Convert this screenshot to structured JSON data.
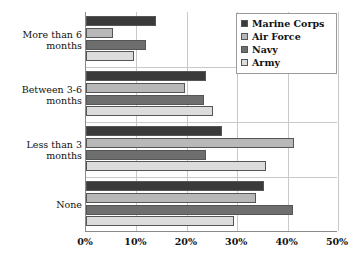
{
  "chart_data": {
    "type": "bar",
    "orientation": "horizontal",
    "title": "",
    "xlabel": "",
    "ylabel": "",
    "categories": [
      "More than 6 months",
      "Between 3-6 months",
      "Less than 3 months",
      "None"
    ],
    "series": [
      {
        "name": "Marine Corps",
        "color": "#3a3a3a",
        "values": [
          13.9,
          23.9,
          27.0,
          35.3
        ]
      },
      {
        "name": "Air Force",
        "color": "#b8b8b8",
        "values": [
          5.4,
          19.6,
          41.3,
          33.8
        ]
      },
      {
        "name": "Navy",
        "color": "#6e6e6e",
        "values": [
          11.9,
          23.5,
          23.8,
          41.0
        ]
      },
      {
        "name": "Army",
        "color": "#dcdcdc",
        "values": [
          9.5,
          25.2,
          35.8,
          29.3
        ]
      }
    ],
    "xlim": [
      0,
      50
    ],
    "xticks": [
      0,
      10,
      20,
      30,
      40,
      50
    ],
    "xtick_labels": [
      "0%",
      "10%",
      "20%",
      "30%",
      "40%",
      "50%"
    ],
    "grid": true,
    "legend_position": "top-right"
  },
  "legend": {
    "entries": [
      {
        "label": "Marine Corps"
      },
      {
        "label": "Air Force"
      },
      {
        "label": "Navy"
      },
      {
        "label": "Army"
      }
    ]
  },
  "category_labels": [
    {
      "line1": "More than 6",
      "line2": "months"
    },
    {
      "line1": "Between 3-6",
      "line2": "months"
    },
    {
      "line1": "Less than 3",
      "line2": "months"
    },
    {
      "line1": "None",
      "line2": ""
    }
  ]
}
